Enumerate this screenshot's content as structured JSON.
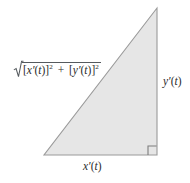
{
  "figure": {
    "type": "geometry-diagram",
    "shape": "right-triangle"
  },
  "colors": {
    "background": "#ffffff",
    "triangle_fill": "#e6e6e6",
    "triangle_stroke": "#9a9a9a",
    "text": "#2b2b2b",
    "rule": "#555a5e",
    "right_angle_marker": "#7d7d7d"
  },
  "geometry": {
    "vertices": {
      "bottom_left": [
        44,
        155
      ],
      "bottom_right": [
        157,
        155
      ],
      "top_right": [
        157,
        8
      ]
    },
    "right_angle_at": "bottom_right",
    "right_angle_marker_size": 9,
    "base_length_px": 113,
    "height_length_px": 147
  },
  "labels": {
    "hypotenuse": {
      "name": "arc-length-expression",
      "radical_glyph": "√",
      "radicand_parts": {
        "x_bracket_open": "[",
        "x_var": "x",
        "x_prime": "′",
        "x_paren_open": "(",
        "x_arg": "t",
        "x_paren_close": ")",
        "x_bracket_close": "]",
        "x_exponent": "2",
        "operator": "+",
        "y_bracket_open": "[",
        "y_var": "y",
        "y_prime": "′",
        "y_paren_open": "(",
        "y_arg": "t",
        "y_paren_close": ")",
        "y_bracket_close": "]",
        "y_exponent": "2"
      },
      "plain_text": "√([x′(t)]² + [y′(t)]²)"
    },
    "vertical_leg": {
      "name": "y-prime-of-t",
      "var": "y",
      "prime": "′",
      "paren_open": "(",
      "arg": "t",
      "paren_close": ")",
      "plain_text": "y′(t)"
    },
    "horizontal_leg": {
      "name": "x-prime-of-t",
      "var": "x",
      "prime": "′",
      "paren_open": "(",
      "arg": "t",
      "paren_close": ")",
      "plain_text": "x′(t)"
    }
  }
}
